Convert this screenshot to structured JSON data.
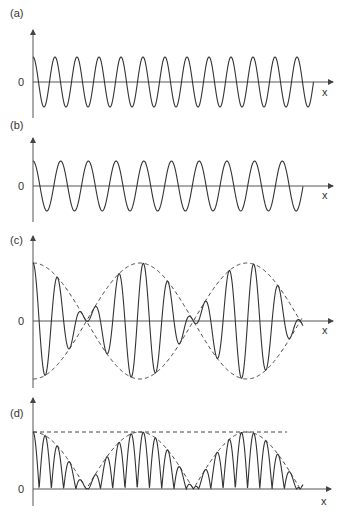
{
  "figure": {
    "panels": [
      {
        "id": "a",
        "label": "(a)",
        "zero_label": "0",
        "x_label": "x",
        "description": "Cosine wave, wavelength λ1 (shorter)"
      },
      {
        "id": "b",
        "label": "(b)",
        "zero_label": "0",
        "x_label": "x",
        "description": "Cosine wave, wavelength λ2 (longer)"
      },
      {
        "id": "c",
        "label": "(c)",
        "zero_label": "0",
        "x_label": "x",
        "description": "Superposition (a)+(b) showing beats with dashed envelope"
      },
      {
        "id": "d",
        "label": "(d)",
        "zero_label": "0",
        "x_label": "x",
        "description": "Magnitude of superposition with dashed envelope and dashed maximum line"
      }
    ]
  },
  "chart_data": [
    {
      "type": "line",
      "panel": "a",
      "title": "(a)",
      "xlabel": "x",
      "ylabel": "",
      "function": "cos(2πx/λ1)",
      "period_px": 22.0,
      "amplitude": 1,
      "cycles_shown": 12.75,
      "y_ticks": [
        "0"
      ],
      "grid": false
    },
    {
      "type": "line",
      "panel": "b",
      "title": "(b)",
      "xlabel": "x",
      "ylabel": "",
      "function": "cos(2πx/λ2)",
      "period_px": 27.7,
      "amplitude": 1,
      "cycles_shown": 9.75,
      "y_ticks": [
        "0"
      ],
      "grid": false
    },
    {
      "type": "line",
      "panel": "c",
      "title": "(c)",
      "xlabel": "x",
      "ylabel": "",
      "function": "cos(2πx/λ1)+cos(2πx/λ2)",
      "envelope": "±2|cos(πx(1/λ1−1/λ2))|",
      "envelope_style": "dashed",
      "nodes_px_from_origin": [
        53,
        162,
        270
      ],
      "y_ticks": [
        "0"
      ],
      "grid": false
    },
    {
      "type": "line",
      "panel": "d",
      "title": "(d)",
      "xlabel": "x",
      "ylabel": "",
      "function": "|cos(2πx/λ1)+cos(2πx/λ2)|",
      "envelope": "2|cos(πx(1/λ1−1/λ2))|",
      "envelope_style": "dashed",
      "max_line": "dashed horizontal at envelope maximum",
      "y_ticks": [
        "0"
      ],
      "grid": false
    }
  ]
}
